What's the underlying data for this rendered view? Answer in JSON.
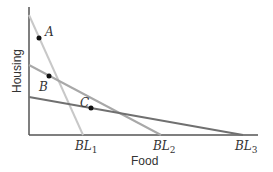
{
  "axes": {
    "x_label": "Food",
    "y_label": "Housing"
  },
  "budget_lines": [
    {
      "name": "BL",
      "sub": "1",
      "color": "#c8c8c8"
    },
    {
      "name": "BL",
      "sub": "2",
      "color": "#a8a8a8"
    },
    {
      "name": "BL",
      "sub": "3",
      "color": "#707070"
    }
  ],
  "points": [
    {
      "label": "A"
    },
    {
      "label": "B"
    },
    {
      "label": "C"
    }
  ]
}
